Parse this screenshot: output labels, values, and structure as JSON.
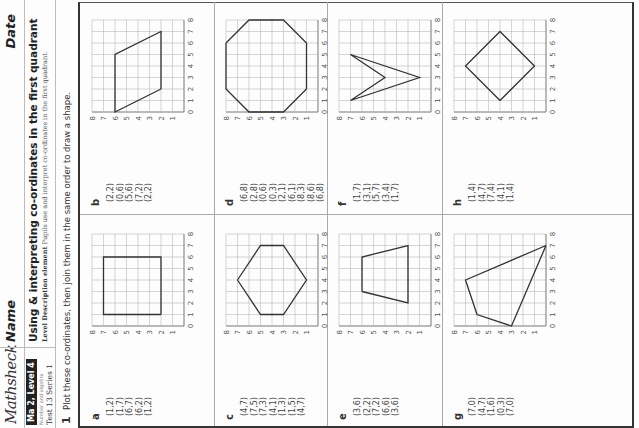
{
  "header": {
    "logo": "Mathsheck",
    "name_label": "Name",
    "date_label": "Date",
    "badge": "Ma 2, Level 4",
    "strand": "Number and algebra",
    "test": "Test 13  Series 1",
    "title": "Using & interpreting co-ordinates in the first quadrant",
    "level_description_label": "Level Description element",
    "level_description_text": "Pupils use and interpret co-ordinates in the first quadrant."
  },
  "question": {
    "number": "1",
    "instruction": "Plot these co-ordinates, then join them in the same order to draw a shape."
  },
  "grid": {
    "min": 0,
    "max": 8,
    "x_ticks": [
      "0",
      "1",
      "2",
      "3",
      "4",
      "5",
      "6",
      "7",
      "8"
    ],
    "y_ticks": [
      "0",
      "1",
      "2",
      "3",
      "4",
      "5",
      "6",
      "7",
      "8"
    ],
    "line_color": "#bbbbbb",
    "shape_color": "#333333"
  },
  "panels": [
    {
      "label": "a",
      "coords": [
        "(1,2)",
        "(1,7)",
        "(6,7)",
        "(6,2)",
        "(1,2)"
      ],
      "points": [
        [
          1,
          2
        ],
        [
          1,
          7
        ],
        [
          6,
          7
        ],
        [
          6,
          2
        ],
        [
          1,
          2
        ]
      ]
    },
    {
      "label": "b",
      "coords": [
        "(2,2)",
        "(0,6)",
        "(5,6)",
        "(7,2)",
        "(2,2)"
      ],
      "points": [
        [
          2,
          2
        ],
        [
          0,
          6
        ],
        [
          5,
          6
        ],
        [
          7,
          2
        ],
        [
          2,
          2
        ]
      ]
    },
    {
      "label": "c",
      "coords": [
        "(4,7)",
        "(7,5)",
        "(7,3)",
        "(4,1)",
        "(1,3)",
        "(1,5)",
        "(4,7)"
      ],
      "points": [
        [
          4,
          7
        ],
        [
          7,
          5
        ],
        [
          7,
          3
        ],
        [
          4,
          1
        ],
        [
          1,
          3
        ],
        [
          1,
          5
        ],
        [
          4,
          7
        ]
      ]
    },
    {
      "label": "d",
      "coords": [
        "(6,8)",
        "(2,8)",
        "(0,6)",
        "(0,3)",
        "(2,1)",
        "(6,1)",
        "(8,3)",
        "(8,6)",
        "(6,8)"
      ],
      "points": [
        [
          6,
          8
        ],
        [
          2,
          8
        ],
        [
          0,
          6
        ],
        [
          0,
          3
        ],
        [
          2,
          1
        ],
        [
          6,
          1
        ],
        [
          8,
          3
        ],
        [
          8,
          6
        ],
        [
          6,
          8
        ]
      ]
    },
    {
      "label": "e",
      "coords": [
        "(3,6)",
        "(2,2)",
        "(7,2)",
        "(6,6)",
        "(3,6)"
      ],
      "points": [
        [
          3,
          6
        ],
        [
          2,
          2
        ],
        [
          7,
          2
        ],
        [
          6,
          6
        ],
        [
          3,
          6
        ]
      ]
    },
    {
      "label": "f",
      "coords": [
        "(1,7)",
        "(3,1)",
        "(5,7)",
        "(3,4)",
        "(1,7)"
      ],
      "points": [
        [
          1,
          7
        ],
        [
          3,
          1
        ],
        [
          5,
          7
        ],
        [
          3,
          4
        ],
        [
          1,
          7
        ]
      ]
    },
    {
      "label": "g",
      "coords": [
        "(7,0)",
        "(4,7)",
        "(1,6)",
        "(0,3)",
        "(7,0)"
      ],
      "points": [
        [
          7,
          0
        ],
        [
          4,
          7
        ],
        [
          1,
          6
        ],
        [
          0,
          3
        ],
        [
          7,
          0
        ]
      ]
    },
    {
      "label": "h",
      "coords": [
        "(1,4)",
        "(4,7)",
        "(7,4)",
        "(4,1)",
        "(1,4)"
      ],
      "points": [
        [
          1,
          4
        ],
        [
          4,
          7
        ],
        [
          7,
          4
        ],
        [
          4,
          1
        ],
        [
          1,
          4
        ]
      ]
    }
  ]
}
